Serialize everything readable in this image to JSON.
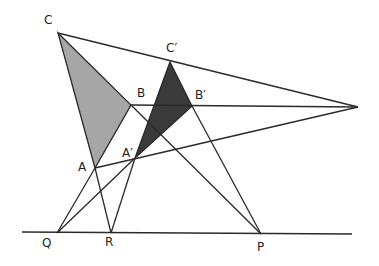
{
  "colors": {
    "line": "#2a2a2a",
    "triangle_abc_fill": "#a6a6a6",
    "triangle_a2b2c2_fill": "#3a3a3a",
    "background": "#ffffff"
  },
  "points": {
    "C": {
      "label": "C",
      "x": 58,
      "y": 33,
      "lx": 44,
      "ly": 14
    },
    "B": {
      "label": "B",
      "x": 131,
      "y": 105,
      "lx": 137,
      "ly": 86
    },
    "A": {
      "label": "A",
      "x": 95,
      "y": 168,
      "lx": 77,
      "ly": 161
    },
    "C2": {
      "label": "C′",
      "x": 170,
      "y": 62,
      "lx": 166,
      "ly": 42
    },
    "B2": {
      "label": "B′",
      "x": 192,
      "y": 106,
      "lx": 194,
      "ly": 88
    },
    "A2": {
      "label": "A′",
      "x": 135,
      "y": 158,
      "lx": 122,
      "ly": 146
    },
    "V": {
      "label": "",
      "x": 358,
      "y": 107
    },
    "Q": {
      "label": "Q",
      "x": 57,
      "y": 233,
      "lx": 42,
      "ly": 237
    },
    "R": {
      "label": "R",
      "x": 111,
      "y": 233,
      "lx": 104,
      "ly": 236
    },
    "P": {
      "label": "P",
      "x": 261,
      "y": 234,
      "lx": 257,
      "ly": 240
    }
  },
  "axis_line": {
    "x1": 22,
    "y1": 232,
    "x2": 352,
    "y2": 234
  },
  "labels": [
    "C",
    "B",
    "A",
    "C′",
    "B′",
    "A′",
    "Q",
    "R",
    "P"
  ]
}
